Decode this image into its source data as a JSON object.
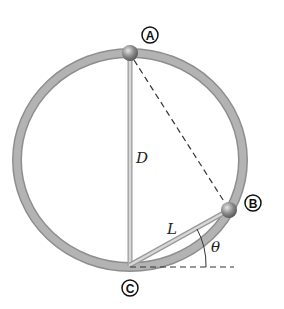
{
  "diagram": {
    "colors": {
      "ring": "#a8a8a8",
      "ring_edge": "#8e8e8e",
      "wire": "#c4c4c4",
      "ball": "#8a8a8a",
      "dashed": "#333333",
      "text": "#222222"
    },
    "points": [
      {
        "id": "A",
        "label": "A",
        "ball_x": 130,
        "ball_y": 53,
        "label_x": 150,
        "label_y": 35
      },
      {
        "id": "B",
        "label": "B",
        "ball_x": 229,
        "ball_y": 210,
        "label_x": 253,
        "label_y": 203
      },
      {
        "id": "C",
        "label": "C",
        "x": 130,
        "y": 266,
        "label_x": 130,
        "label_y": 288
      }
    ],
    "labels": {
      "diameter": "D",
      "length": "L",
      "angle": "θ"
    },
    "ring": {
      "cx": 130,
      "cy": 160,
      "rx": 113,
      "ry": 107,
      "stroke_width": 9
    }
  }
}
